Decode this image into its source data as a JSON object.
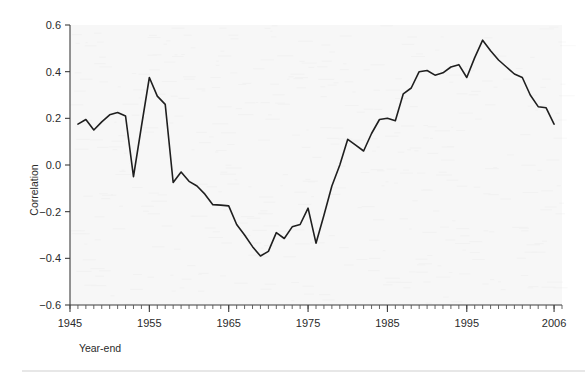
{
  "figure": {
    "background_color": "#ffffff",
    "plot_background_color": "#f7f7f7",
    "line_color": "#1f1f1f",
    "axis_color": "#3c3c3c",
    "bottom_rule_color": "#cfcfcf"
  },
  "chart_data": {
    "type": "line",
    "title": "",
    "subtitle": "",
    "xlabel": "Year-end",
    "ylabel": "Correlation",
    "xlim": [
      1945,
      2007
    ],
    "ylim": [
      -0.6,
      0.6
    ],
    "grid": false,
    "legend": null,
    "x_ticks_major": [
      1945,
      1955,
      1965,
      1975,
      1985,
      1995,
      2006
    ],
    "x_tick_labels": [
      "1945",
      "1955",
      "1965",
      "1975",
      "1985",
      "1995",
      "2006"
    ],
    "x_minor_tick_step": 1,
    "y_ticks": [
      -0.6,
      -0.4,
      -0.2,
      0.0,
      0.2,
      0.4,
      0.6
    ],
    "y_tick_labels": [
      "−0.6",
      "−0.4",
      "−0.2",
      "0.0",
      "0.2",
      "0.4",
      "0.6"
    ],
    "series": [
      {
        "name": "Correlation",
        "color": "#1f1f1f",
        "x": [
          1946,
          1947,
          1948,
          1949,
          1950,
          1951,
          1952,
          1953,
          1954,
          1955,
          1956,
          1957,
          1958,
          1959,
          1960,
          1961,
          1962,
          1963,
          1964,
          1965,
          1966,
          1967,
          1968,
          1969,
          1970,
          1971,
          1972,
          1973,
          1974,
          1975,
          1976,
          1977,
          1978,
          1979,
          1980,
          1981,
          1982,
          1983,
          1984,
          1985,
          1986,
          1987,
          1988,
          1989,
          1990,
          1991,
          1992,
          1993,
          1994,
          1995,
          1996,
          1997,
          1998,
          1999,
          2000,
          2001,
          2002,
          2003,
          2004,
          2005,
          2006
        ],
        "y": [
          0.175,
          0.195,
          0.15,
          0.185,
          0.215,
          0.225,
          0.21,
          -0.05,
          0.165,
          0.375,
          0.295,
          0.26,
          -0.075,
          -0.03,
          -0.07,
          -0.09,
          -0.125,
          -0.17,
          -0.172,
          -0.175,
          -0.255,
          -0.3,
          -0.35,
          -0.39,
          -0.37,
          -0.29,
          -0.315,
          -0.265,
          -0.255,
          -0.185,
          -0.335,
          -0.215,
          -0.09,
          0.0,
          0.11,
          0.085,
          0.06,
          0.135,
          0.195,
          0.2,
          0.19,
          0.305,
          0.33,
          0.4,
          0.405,
          0.385,
          0.395,
          0.42,
          0.43,
          0.375,
          0.46,
          0.535,
          0.49,
          0.45,
          0.42,
          0.39,
          0.375,
          0.3,
          0.25,
          0.245,
          0.175
        ]
      }
    ],
    "annotations": []
  }
}
